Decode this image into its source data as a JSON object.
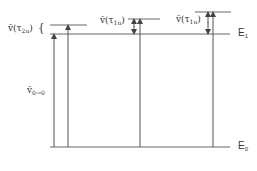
{
  "diagram": {
    "type": "energy-level-diagram",
    "levels": [
      {
        "id": "E1",
        "label": "E",
        "sub": "1"
      },
      {
        "id": "E0",
        "label": "E",
        "sub": "0"
      }
    ],
    "labels": {
      "tau2u": {
        "main": "ṽ(τ",
        "sub": "2u",
        "close": ")",
        "brace": "{"
      },
      "tau1u_mid": {
        "main": "ṽ(τ",
        "sub": "1u",
        "close": ")"
      },
      "tau1u_right": {
        "main": "ṽ(τ",
        "sub": "1u",
        "close": ")"
      },
      "v00": {
        "main": "ṽ",
        "sub": "0→0"
      }
    },
    "colors": {
      "line": "#555555",
      "text": "#333333",
      "background": "#ffffff"
    }
  }
}
